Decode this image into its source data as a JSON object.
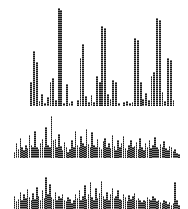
{
  "figure": {
    "background_color": "#ffffff",
    "bar_color": "#1a1a1a",
    "panel_count": 3,
    "style": "halftone-dithered bars, no axes, no labels"
  },
  "panels": [
    {
      "name": "top-panel",
      "label": ""
    },
    {
      "name": "middle-panel",
      "label": ""
    },
    {
      "name": "bottom-panel",
      "label": ""
    }
  ],
  "chart_data": [
    {
      "type": "bar",
      "title": "",
      "subtitle": "",
      "xlabel": "",
      "ylabel": "",
      "grid": false,
      "legend": null,
      "axis_visible": false,
      "panel": "top-panel",
      "ylim": [
        0,
        100
      ],
      "bar_color": "#1a1a1a",
      "categories": [
        "1",
        "2",
        "3",
        "4",
        "5",
        "6",
        "7",
        "8",
        "9",
        "10",
        "11",
        "12",
        "13",
        "14",
        "15",
        "16",
        "17",
        "18",
        "19",
        "20",
        "21",
        "22",
        "23",
        "24",
        "25",
        "26",
        "27",
        "28",
        "29",
        "30",
        "31",
        "32",
        "33",
        "34",
        "35",
        "36",
        "37",
        "38",
        "39",
        "40",
        "41",
        "42",
        "43",
        "44",
        "45",
        "46",
        "47",
        "48",
        "49",
        "50"
      ],
      "values": [
        0,
        0,
        0,
        0,
        0,
        0,
        24,
        55,
        44,
        5,
        12,
        3,
        9,
        24,
        28,
        6,
        98,
        96,
        3,
        22,
        3,
        5,
        0,
        6,
        48,
        62,
        10,
        4,
        11,
        4,
        30,
        24,
        80,
        78,
        12,
        7,
        26,
        24,
        3,
        0,
        4,
        5,
        3,
        4,
        68,
        66,
        24,
        7,
        13,
        6,
        30,
        34,
        88,
        86,
        14,
        5,
        48,
        46,
        6,
        0
      ],
      "notes": "sparse tall spikes rising from baseline; tallest ~full height near x=17 and x=53"
    },
    {
      "type": "bar",
      "title": "",
      "subtitle": "",
      "xlabel": "",
      "ylabel": "",
      "grid": false,
      "legend": null,
      "axis_visible": false,
      "panel": "middle-panel",
      "ylim": [
        0,
        100
      ],
      "bar_color": "#1a1a1a",
      "categories": [
        "1",
        "2",
        "3",
        "4",
        "5",
        "6",
        "7",
        "8",
        "9",
        "10",
        "11",
        "12",
        "13",
        "14",
        "15",
        "16",
        "17",
        "18",
        "19",
        "20",
        "21",
        "22",
        "23",
        "24",
        "25",
        "26",
        "27",
        "28",
        "29",
        "30",
        "31",
        "32",
        "33",
        "34",
        "35",
        "36",
        "37",
        "38",
        "39",
        "40",
        "41",
        "42",
        "43",
        "44",
        "45",
        "46",
        "47",
        "48",
        "49",
        "50",
        "51",
        "52",
        "53",
        "54",
        "55",
        "56",
        "57",
        "58",
        "59",
        "60",
        "61",
        "62",
        "63",
        "64",
        "65",
        "66",
        "67",
        "68",
        "69",
        "70",
        "71",
        "72",
        "73",
        "74",
        "75",
        "76",
        "77",
        "78",
        "79",
        "80",
        "81",
        "82",
        "83",
        "84",
        "85",
        "86",
        "87",
        "88",
        "89",
        "90"
      ],
      "values": [
        14,
        34,
        20,
        46,
        26,
        18,
        30,
        22,
        52,
        30,
        24,
        62,
        26,
        20,
        34,
        44,
        24,
        70,
        30,
        26,
        96,
        40,
        44,
        24,
        54,
        28,
        18,
        36,
        24,
        14,
        20,
        40,
        26,
        62,
        30,
        24,
        50,
        34,
        28,
        66,
        32,
        24,
        58,
        30,
        26,
        44,
        24,
        20,
        38,
        46,
        26,
        34,
        22,
        52,
        28,
        18,
        40,
        24,
        34,
        50,
        22,
        18,
        30,
        42,
        24,
        28,
        36,
        20,
        46,
        24,
        18,
        34,
        26,
        40,
        22,
        30,
        48,
        24,
        20,
        32,
        26,
        38,
        22,
        18,
        28,
        24,
        16,
        20,
        12,
        8
      ],
      "notes": "dense city-skyline profile; one tall spike near x=21, gradual decline at right edge"
    },
    {
      "type": "bar",
      "title": "",
      "subtitle": "",
      "xlabel": "",
      "ylabel": "",
      "grid": false,
      "legend": null,
      "axis_visible": false,
      "panel": "bottom-panel",
      "ylim": [
        0,
        100
      ],
      "bar_color": "#1a1a1a",
      "categories": [
        "1",
        "2",
        "3",
        "4",
        "5",
        "6",
        "7",
        "8",
        "9",
        "10",
        "11",
        "12",
        "13",
        "14",
        "15",
        "16",
        "17",
        "18",
        "19",
        "20",
        "21",
        "22",
        "23",
        "24",
        "25",
        "26",
        "27",
        "28",
        "29",
        "30",
        "31",
        "32",
        "33",
        "34",
        "35",
        "36",
        "37",
        "38",
        "39",
        "40",
        "41",
        "42",
        "43",
        "44",
        "45",
        "46",
        "47",
        "48",
        "49",
        "50",
        "51",
        "52",
        "53",
        "54",
        "55",
        "56",
        "57",
        "58",
        "59",
        "60",
        "61",
        "62",
        "63",
        "64",
        "65",
        "66",
        "67",
        "68",
        "69",
        "70",
        "71",
        "72",
        "73",
        "74",
        "75",
        "76",
        "77",
        "78",
        "79",
        "80",
        "81",
        "82",
        "83",
        "84",
        "85",
        "86",
        "87",
        "88",
        "89",
        "90"
      ],
      "values": [
        30,
        18,
        24,
        40,
        22,
        34,
        26,
        46,
        28,
        20,
        38,
        24,
        52,
        30,
        22,
        44,
        26,
        74,
        34,
        58,
        28,
        24,
        40,
        20,
        30,
        26,
        36,
        22,
        18,
        28,
        24,
        14,
        20,
        34,
        26,
        44,
        22,
        30,
        56,
        24,
        34,
        62,
        28,
        20,
        48,
        26,
        38,
        66,
        30,
        24,
        40,
        22,
        34,
        50,
        26,
        30,
        44,
        24,
        20,
        36,
        28,
        18,
        32,
        24,
        30,
        38,
        22,
        26,
        20,
        16,
        22,
        18,
        28,
        24,
        20,
        30,
        26,
        18,
        22,
        16,
        14,
        20,
        18,
        12,
        16,
        10,
        14,
        62,
        20,
        10
      ],
      "notes": "dense skyline, slightly lower overall than middle; isolated tall spike near x=88"
    }
  ]
}
